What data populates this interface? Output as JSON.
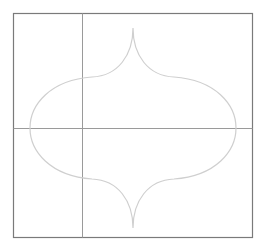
{
  "canvas": {
    "background": "#ffffff",
    "frame_color": "#7a7a7a",
    "guide_color": "#9a9a9a",
    "shape_color": "#cfcfcf"
  },
  "shape": {
    "name": "ogee-arch-lantern",
    "description": "Symmetric lantern/ogee tile outline with pointed cusps at top and bottom"
  },
  "guides": {
    "vertical": "vertical-guide",
    "horizontal": "horizontal-guide"
  }
}
